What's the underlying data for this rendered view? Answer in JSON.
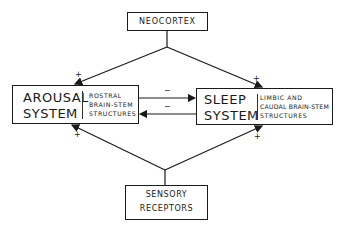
{
  "nodes": {
    "neocortex": {
      "label": "NEOCORTEX"
    },
    "arousal": {
      "title_line1": "AROUSAL",
      "title_line2": "SYSTEM",
      "sub_line1": "ROSTRAL",
      "sub_line2": "BRAIN-STEM",
      "sub_line3": "STRUCTURES"
    },
    "sleep": {
      "title_line1": "SLEEP",
      "title_line2": "SYSTEM",
      "sub_line1": "LIMBIC  AND",
      "sub_line2": "CAUDAL BRAIN-STEM",
      "sub_line3": "STRUCTURES"
    },
    "sensory": {
      "label_line1": "SENSORY",
      "label_line2": "RECEPTORS"
    }
  },
  "edges": [
    {
      "from": "neocortex",
      "to": "arousal",
      "sign": "+"
    },
    {
      "from": "neocortex",
      "to": "sleep",
      "sign": "+"
    },
    {
      "from": "sensory",
      "to": "arousal",
      "sign": "+"
    },
    {
      "from": "sensory",
      "to": "sleep",
      "sign": "+"
    },
    {
      "from": "arousal",
      "to": "sleep",
      "sign": "−"
    },
    {
      "from": "sleep",
      "to": "arousal",
      "sign": "−"
    }
  ],
  "signs": {
    "plus": "+",
    "minus": "−"
  }
}
